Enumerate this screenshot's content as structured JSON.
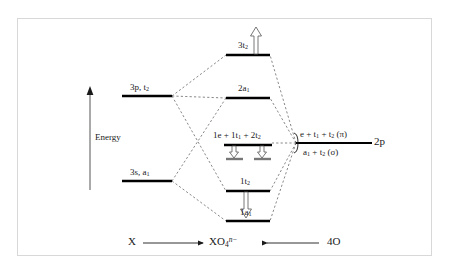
{
  "figure": {
    "type": "molecular-orbital-energy-level-diagram",
    "title_visible": false,
    "frame_color": "#d8d8d8",
    "background": "#ffffff",
    "line_color": "#000000"
  },
  "axis": {
    "label": "Energy",
    "direction": "up",
    "arrow_icon": "up-arrow-icon"
  },
  "left_fragment": {
    "name": "X",
    "levels": [
      {
        "id": "3p",
        "label_html": "3p, t<sub>2</sub>",
        "label_text": "3p, t2"
      },
      {
        "id": "3s",
        "label_html": "3s, a<sub>1</sub>",
        "label_text": "3s, a1"
      }
    ]
  },
  "right_fragment": {
    "name": "4O",
    "orbital_label": "2p",
    "upper_label_html": "e + t<sub>1</sub> + t<sub>2</sub> (&#960;)",
    "upper_label_text": "e + t1 + t2 (pi)",
    "lower_label_html": "a<sub>1</sub> + t<sub>2</sub> (&#963;)",
    "lower_label_text": "a1 + t2 (sigma)"
  },
  "molecular_levels": [
    {
      "id": "3t2",
      "label_html": "3t<sub>2</sub>",
      "label_text": "3t2",
      "arrow": "up"
    },
    {
      "id": "2a1",
      "label_html": "2a<sub>1</sub>",
      "label_text": "2a1",
      "arrow": "none"
    },
    {
      "id": "nonbonding",
      "label_html": "1e + 1t<sub>1</sub> + 2t<sub>2</sub>",
      "label_text": "1e + 1t1 + 2t2",
      "arrow": "down-pair"
    },
    {
      "id": "1t2",
      "label_html": "1t<sub>2</sub>",
      "label_text": "1t2",
      "arrow": "down"
    },
    {
      "id": "1a1",
      "label_html": "1a<sub>1</sub>",
      "label_text": "1a1",
      "arrow": "none"
    }
  ],
  "bottom_axis": {
    "left_species": "X",
    "center_species_html": "XO<sub>4</sub><sup class=\"ital\">n&#8722;</sup>",
    "center_species_text": "XO4 n-",
    "right_species": "4O",
    "left_arrow_icon": "right-arrow-icon",
    "right_arrow_icon": "left-arrow-icon"
  }
}
